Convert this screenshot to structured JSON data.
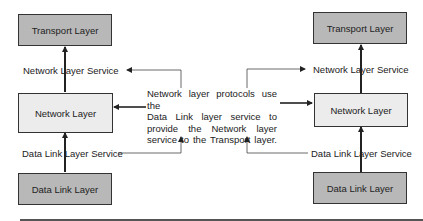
{
  "diagram": {
    "left_stack": {
      "transport_box": "Transport Layer",
      "network_service_label": "Network Layer Service",
      "network_box": "Network Layer",
      "datalink_service_label": "Data Link Layer Service",
      "datalink_box": "Data Link Layer"
    },
    "right_stack": {
      "transport_box": "Transport Layer",
      "network_service_label": "Network Layer Service",
      "network_box": "Network Layer",
      "datalink_service_label": "Data Link Layer Service",
      "datalink_box": "Data Link Layer"
    },
    "description": {
      "lines": [
        "Network layer protocols use the",
        "Data Link layer service to",
        "provide the Network layer",
        "service to the Transport layer."
      ]
    },
    "colors": {
      "dark_box_fill": "#b8b8b8",
      "light_box_fill": "#ececec",
      "stroke": "#333333"
    }
  }
}
